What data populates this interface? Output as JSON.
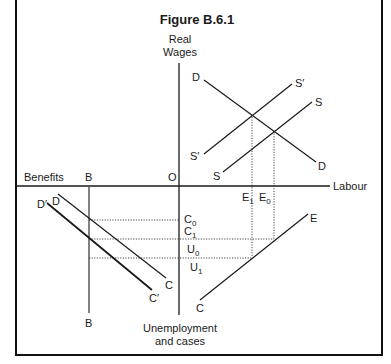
{
  "figure": {
    "title": "Figure B.6.1",
    "axes": {
      "vertical_top_label_line1": "Real",
      "vertical_top_label_line2": "Wages",
      "vertical_bottom_label_line1": "Unemployment",
      "vertical_bottom_label_line2": "and cases",
      "horizontal_left_label": "Benefits",
      "horizontal_right_label": "Labour",
      "origin_label": "O"
    },
    "upper_right_quadrant": {
      "demand_top_label": "D",
      "demand_bottom_label": "D",
      "supply_shifted_top_label": "S′",
      "supply_shifted_bottom_label": "S′",
      "supply_top_label": "S",
      "supply_bottom_label": "S"
    },
    "axis_markers": {
      "E1": {
        "main": "E",
        "sub": "1"
      },
      "E0": {
        "main": "E",
        "sub": "0"
      },
      "C0": {
        "main": "C",
        "sub": "0"
      },
      "C1": {
        "main": "C",
        "sub": "1"
      },
      "U0": {
        "main": "U",
        "sub": "0"
      },
      "U1": {
        "main": "U",
        "sub": "1"
      }
    },
    "lower_left_quadrant": {
      "benefit_line_top_label": "B",
      "benefit_line_bottom_label": "B",
      "dc_top_label": "D",
      "dc_bottom_label": "C",
      "dc_shifted_top_label": "D′",
      "dc_shifted_bottom_label": "C′"
    },
    "lower_right_quadrant": {
      "ce_top_label": "E",
      "ce_bottom_label": "C"
    },
    "colors": {
      "line": "#1a1a1a",
      "background": "#ffffff"
    }
  }
}
